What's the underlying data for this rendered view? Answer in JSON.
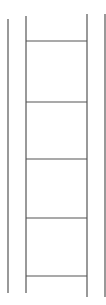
{
  "diagram": {
    "type": "ladder-line-drawing",
    "stroke_color": "#555555",
    "background": "#ffffff",
    "outer_rails": [
      {
        "x": 8,
        "y1": 19,
        "y2": 293
      },
      {
        "x": 105,
        "y1": 14,
        "y2": 297
      }
    ],
    "inner_rails": [
      {
        "x": 26,
        "y1": 16,
        "y2": 293
      },
      {
        "x": 87,
        "y1": 14,
        "y2": 297
      }
    ],
    "rungs_y": [
      41,
      102,
      159,
      218,
      276
    ]
  }
}
